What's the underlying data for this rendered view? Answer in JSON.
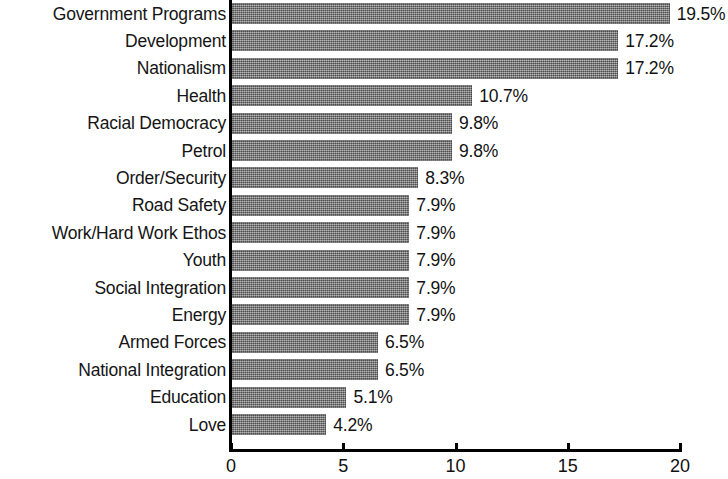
{
  "chart_data": {
    "type": "bar",
    "orientation": "horizontal",
    "title": "",
    "subtitle": "",
    "xlabel": "",
    "ylabel": "",
    "xlim": [
      0,
      20
    ],
    "xticks": [
      0,
      5,
      10,
      15,
      20
    ],
    "xtick_labels": [
      "0",
      "5",
      "10",
      "15",
      "20"
    ],
    "grid": false,
    "legend": null,
    "bar_color": "#6e6e6e",
    "background_color": "#ffffff",
    "axis_color": "#000000",
    "categories": [
      "Government Programs",
      "Development",
      "Nationalism",
      "Health",
      "Racial Democracy",
      "Petrol",
      "Order/Security",
      "Road Safety",
      "Work/Hard Work Ethos",
      "Youth",
      "Social Integration",
      "Energy",
      "Armed Forces",
      "National Integration",
      "Education",
      "Love"
    ],
    "values": [
      19.5,
      17.2,
      17.2,
      10.7,
      9.8,
      9.8,
      8.3,
      7.9,
      7.9,
      7.9,
      7.9,
      7.9,
      6.5,
      6.5,
      5.1,
      4.2
    ],
    "value_labels": [
      "19.5%",
      "17.2%",
      "17.2%",
      "10.7%",
      "9.8%",
      "9.8%",
      "8.3%",
      "7.9%",
      "7.9%",
      "7.9%",
      "7.9%",
      "7.9%",
      "6.5%",
      "6.5%",
      "5.1%",
      "4.2%"
    ]
  }
}
